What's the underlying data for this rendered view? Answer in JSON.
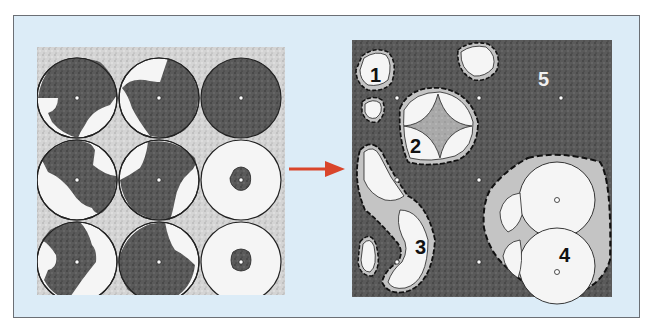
{
  "figure": {
    "background_color": "#dcecf7",
    "arrow_color": "#d9452b",
    "left_panel": {
      "name": "initial-packing",
      "grid": "3x3",
      "particles": 9
    },
    "right_panel": {
      "name": "sintered-structure",
      "labels": [
        "1",
        "2",
        "3",
        "4",
        "5"
      ]
    }
  }
}
